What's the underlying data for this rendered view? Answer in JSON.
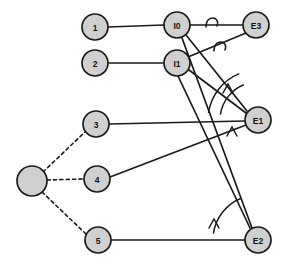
{
  "diagram": {
    "canvas": {
      "width": 286,
      "height": 265,
      "background": "#ffffff"
    },
    "style": {
      "node_fill": "#d0d0d0",
      "node_stroke": "#1a1a1a",
      "edge_color": "#1a1a1a",
      "label_color": "#111111"
    },
    "nodes": [
      {
        "id": "n1",
        "label": "1",
        "cx": 95,
        "cy": 27,
        "r": 13,
        "shape": "circle"
      },
      {
        "id": "n2",
        "label": "2",
        "cx": 95,
        "cy": 63,
        "r": 13,
        "shape": "circle"
      },
      {
        "id": "n3",
        "label": "3",
        "cx": 96,
        "cy": 124,
        "r": 13,
        "shape": "circle"
      },
      {
        "id": "n4",
        "label": "4",
        "cx": 97,
        "cy": 179,
        "r": 13,
        "shape": "circle"
      },
      {
        "id": "n5",
        "label": "5",
        "cx": 98,
        "cy": 240,
        "r": 13,
        "shape": "circle"
      },
      {
        "id": "hub",
        "label": "",
        "cx": 32,
        "cy": 181,
        "r": 15,
        "shape": "circle"
      },
      {
        "id": "i0",
        "label": "I0",
        "cx": 177,
        "cy": 25,
        "r": 13,
        "shape": "circle"
      },
      {
        "id": "i1",
        "label": "I1",
        "cx": 177,
        "cy": 63,
        "r": 13,
        "shape": "circle"
      },
      {
        "id": "e3",
        "label": "E3",
        "cx": 256,
        "cy": 25,
        "r": 13,
        "shape": "circle"
      },
      {
        "id": "e1",
        "label": "E1",
        "cx": 258,
        "cy": 120,
        "r": 13,
        "shape": "circle"
      },
      {
        "id": "e2",
        "label": "E2",
        "cx": 258,
        "cy": 240,
        "r": 13,
        "shape": "circle"
      }
    ],
    "edges": [
      {
        "id": "edge-n1-i0",
        "from": "n1",
        "to": "i0",
        "style": "solid",
        "x1": 108,
        "y1": 27,
        "x2": 164,
        "y2": 25
      },
      {
        "id": "edge-n2-i1",
        "from": "n2",
        "to": "i1",
        "style": "solid",
        "x1": 108,
        "y1": 63,
        "x2": 164,
        "y2": 63
      },
      {
        "id": "edge-i0-e3",
        "from": "i0",
        "to": "e3",
        "style": "solid",
        "x1": 190,
        "y1": 25,
        "x2": 243,
        "y2": 25
      },
      {
        "id": "edge-n3-e1",
        "from": "n3",
        "to": "e1",
        "style": "solid",
        "x1": 109,
        "y1": 124,
        "x2": 245,
        "y2": 121
      },
      {
        "id": "edge-n4-e1",
        "from": "n4",
        "to": "e1",
        "style": "solid",
        "x1": 110,
        "y1": 177,
        "x2": 246,
        "y2": 125
      },
      {
        "id": "edge-n5-e2",
        "from": "n5",
        "to": "e2",
        "style": "solid",
        "x1": 111,
        "y1": 240,
        "x2": 245,
        "y2": 240
      },
      {
        "id": "edge-i0-e1",
        "from": "i0",
        "to": "e1",
        "style": "solid",
        "x1": 186,
        "y1": 35,
        "x2": 247,
        "y2": 111
      },
      {
        "id": "edge-i1-e1",
        "from": "i1",
        "to": "e1",
        "style": "solid",
        "x1": 189,
        "y1": 70,
        "x2": 246,
        "y2": 113
      },
      {
        "id": "edge-i0-e2",
        "from": "i0",
        "to": "e2",
        "style": "solid",
        "x1": 182,
        "y1": 38,
        "x2": 252,
        "y2": 228
      },
      {
        "id": "edge-i1-e2",
        "from": "i1",
        "to": "e2",
        "style": "solid",
        "x1": 178,
        "y1": 76,
        "x2": 250,
        "y2": 228
      },
      {
        "id": "edge-i1-e3",
        "from": "i1",
        "to": "e3",
        "style": "solid",
        "x1": 188,
        "y1": 57,
        "x2": 246,
        "y2": 33
      },
      {
        "id": "edge-hub-n3",
        "from": "hub",
        "to": "n3",
        "style": "dashed",
        "x1": 43,
        "y1": 172,
        "x2": 86,
        "y2": 131
      },
      {
        "id": "edge-hub-n4",
        "from": "hub",
        "to": "n4",
        "style": "dashed",
        "x1": 47,
        "y1": 180,
        "x2": 84,
        "y2": 179
      },
      {
        "id": "edge-hub-n5",
        "from": "hub",
        "to": "n5",
        "style": "dashed",
        "x1": 42,
        "y1": 192,
        "x2": 86,
        "y2": 234
      }
    ],
    "angle_markers": [
      {
        "id": "angle-at-e3-top",
        "near": "e3",
        "kind": "loop-mark",
        "cx": 212,
        "cy": 23
      },
      {
        "id": "angle-at-e3-low",
        "near": "e3",
        "kind": "loop-mark",
        "cx": 220,
        "cy": 47
      },
      {
        "id": "angle-e1-upper",
        "near": "e1",
        "kind": "arc-caret",
        "cx": 258,
        "cy": 120,
        "radius": 50,
        "caret_x": 228,
        "caret_y": 88
      },
      {
        "id": "angle-e1-lower",
        "near": "e1",
        "kind": "arc-caret",
        "cx": 258,
        "cy": 120,
        "radius": 38,
        "caret_x": 232,
        "caret_y": 131
      },
      {
        "id": "angle-e2-large",
        "near": "e2",
        "kind": "arc-caret",
        "cx": 258,
        "cy": 240,
        "radius": 45,
        "caret_x": 214,
        "caret_y": 223
      }
    ],
    "legend": {
      "solid_meaning": "solid connection",
      "dashed_meaning": "dashed connection"
    }
  }
}
